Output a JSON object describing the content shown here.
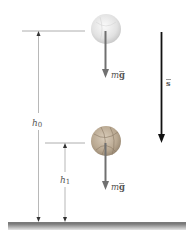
{
  "diagram": {
    "type": "physics-free-fall",
    "labels": {
      "h0": "h",
      "h0_sub": "0",
      "h1": "h",
      "h1_sub": "1",
      "weight_top": "m",
      "weight_top_vec": "g",
      "weight_bottom": "m",
      "weight_bottom_vec": "g",
      "displacement": "s"
    },
    "colors": {
      "background": "#ffffff",
      "guide_lines": "#9a9a9a",
      "force_arrow": "#707070",
      "displacement_arrow": "#111111",
      "ball_top": "#e6e6e6",
      "ball_bottom": "#bfae98",
      "ground": "#8c8c8c"
    },
    "objects": [
      {
        "name": "ball-initial",
        "position": "top",
        "height_label": "h0"
      },
      {
        "name": "ball-final",
        "position": "bottom",
        "height_label": "h1"
      }
    ]
  }
}
